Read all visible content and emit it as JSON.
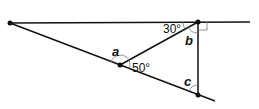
{
  "diagram": {
    "type": "geometry",
    "labels": {
      "angle_30": "30°",
      "angle_50": "50°",
      "angle_a": "a",
      "angle_b": "b",
      "angle_c": "c"
    },
    "points": {
      "left": [
        10,
        23
      ],
      "top_right": [
        198,
        22
      ],
      "middle": [
        120,
        65
      ],
      "bottom": [
        198,
        95
      ]
    },
    "colors": {
      "line": "#111111",
      "arc": "#777777",
      "background": "#ffffff"
    }
  }
}
